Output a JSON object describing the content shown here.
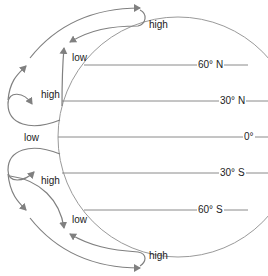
{
  "diagram": {
    "latitudes": [
      {
        "label": "60° N",
        "y": 65
      },
      {
        "label": "30° N",
        "y": 101
      },
      {
        "label": "0°",
        "y": 137
      },
      {
        "label": "30° S",
        "y": 173
      },
      {
        "label": "60° S",
        "y": 210
      }
    ],
    "pressure_labels": {
      "top_high": "high",
      "north_low": "low",
      "north_high": "high",
      "equator_low": "low",
      "south_high": "high",
      "south_low": "low",
      "bottom_high": "high"
    },
    "colors": {
      "line": "#808080",
      "text": "#222222",
      "background": "#ffffff"
    }
  }
}
